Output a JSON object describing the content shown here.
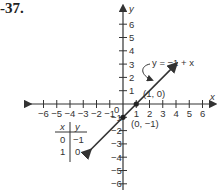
{
  "problem_number": "-37.",
  "chart_data": {
    "type": "line",
    "title": "",
    "xlabel": "x",
    "ylabel": "y",
    "xlim": [
      -6,
      6
    ],
    "ylim": [
      -6,
      6
    ],
    "x_ticks": [
      -6,
      -5,
      -4,
      -3,
      -2,
      -1,
      1,
      2,
      3,
      4,
      5,
      6
    ],
    "y_ticks": [
      -6,
      -5,
      -4,
      -3,
      -2,
      -1,
      1,
      2,
      3,
      4,
      5,
      6
    ],
    "origin_label": "0",
    "series": [
      {
        "name": "y = -1 + x",
        "equation": "y = -1 + x",
        "x": [
          -2.5,
          4
        ],
        "y": [
          -3.5,
          3
        ]
      }
    ],
    "points": [
      {
        "x": 1,
        "y": 0,
        "label": "(1, 0)"
      },
      {
        "x": 0,
        "y": -1,
        "label": "(0, -1)"
      }
    ],
    "annotation": "y = −1 + x",
    "table": {
      "headers": [
        "x",
        "y"
      ],
      "rows": [
        [
          "0",
          "−1"
        ],
        [
          "1",
          "0"
        ]
      ]
    }
  },
  "labels": {
    "x_axis": "x",
    "y_axis": "y",
    "equation": "y = −1 + x",
    "p1": "(1, 0)",
    "p2": "(0, −1)",
    "origin": "0",
    "table_h_x": "x",
    "table_h_y": "y",
    "t_r1_x": "0",
    "t_r1_y": "−1",
    "t_r2_x": "1",
    "t_r2_y": "0"
  }
}
